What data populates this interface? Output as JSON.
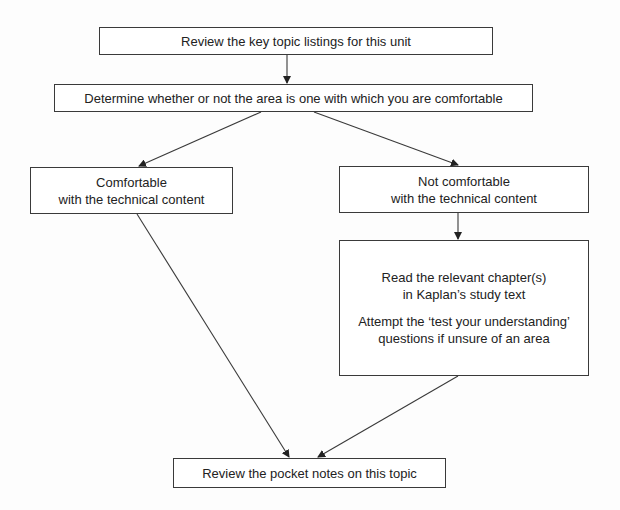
{
  "flowchart": {
    "nodes": {
      "review_topics": {
        "lines": [
          "Review the key topic listings for this unit"
        ]
      },
      "determine": {
        "lines": [
          "Determine whether or not the area is one with which you are comfortable"
        ]
      },
      "comfortable": {
        "lines": [
          "Comfortable",
          "with the technical content"
        ]
      },
      "not_comfortable": {
        "lines": [
          "Not comfortable",
          "with the technical content"
        ]
      },
      "study": {
        "paragraph1": [
          "Read the relevant chapter(s)",
          "in Kaplan’s study text"
        ],
        "paragraph2": [
          "Attempt the ‘test your understanding’",
          "questions if unsure of an area"
        ]
      },
      "pocket_notes": {
        "lines": [
          "Review the pocket notes on this topic"
        ]
      }
    },
    "edges": [
      {
        "from": "review_topics",
        "to": "determine"
      },
      {
        "from": "determine",
        "to": "comfortable"
      },
      {
        "from": "determine",
        "to": "not_comfortable"
      },
      {
        "from": "not_comfortable",
        "to": "study"
      },
      {
        "from": "comfortable",
        "to": "pocket_notes"
      },
      {
        "from": "study",
        "to": "pocket_notes"
      }
    ],
    "colors": {
      "stroke": "#3a3a3a",
      "text": "#222222",
      "background": "#ffffff"
    }
  }
}
